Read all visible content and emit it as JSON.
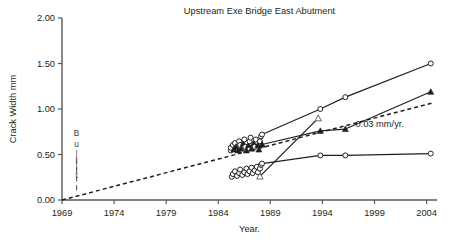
{
  "chart_data": {
    "type": "line",
    "title": "Upstream Exe Bridge East Abutment",
    "xlabel": "Year.",
    "ylabel": "Crack Width mm",
    "xlim": [
      1969,
      2005
    ],
    "ylim": [
      0.0,
      2.0
    ],
    "xticks": [
      1969,
      1974,
      1979,
      1984,
      1989,
      1994,
      1999,
      2004
    ],
    "xticklabels": [
      "1969",
      "1974",
      "1979",
      "1984",
      "1989",
      "1994",
      "1999",
      "2004"
    ],
    "yticks": [
      0.0,
      0.5,
      1.0,
      1.5,
      2.0
    ],
    "yticklabels": [
      "0.00",
      "0.50",
      "1.00",
      "1.50",
      "2.00"
    ],
    "grid": false,
    "legend": "none",
    "annotations": [
      {
        "text": "0.03 mm/yr.",
        "x": 1999.5,
        "y": 0.8,
        "note": "label for dashed reference trend line"
      },
      {
        "text": "Built",
        "x": 1970.4,
        "y": 0.55,
        "orientation": "vertical",
        "note": "vertical stacked letters beside dashed vertical marker at construction date"
      }
    ],
    "reference_line": {
      "name": "0.03 mm/yr.",
      "style": "dashed",
      "slope_mm_per_year": 0.03,
      "x": [
        1969,
        2004.5
      ],
      "y": [
        0.0,
        1.065
      ]
    },
    "series": [
      {
        "name": "Series A (open circle, upper)",
        "marker": "open-circle",
        "x": [
          1988.2,
          1993.8,
          1996.2,
          2004.4
        ],
        "y": [
          0.72,
          1.0,
          1.13,
          1.5
        ]
      },
      {
        "name": "Series B (filled triangle, upper)",
        "marker": "filled-triangle",
        "x": [
          1988.2,
          1993.8,
          1996.2,
          2004.4
        ],
        "y": [
          0.61,
          0.76,
          0.78,
          1.19
        ]
      },
      {
        "name": "Series C (steep riser crossing to open triangle)",
        "marker": "open-triangle",
        "x": [
          1988.0,
          1993.6
        ],
        "y": [
          0.26,
          0.9
        ]
      },
      {
        "name": "Series D (open circle, lower flat)",
        "marker": "open-circle",
        "x": [
          1988.2,
          1993.8,
          1996.2,
          2004.4
        ],
        "y": [
          0.4,
          0.49,
          0.49,
          0.51
        ]
      }
    ],
    "clusters": [
      {
        "name": "Upper measurement cluster",
        "marker": "mixed open-circle and filled-triangle",
        "x_range": [
          1985.0,
          1988.3
        ],
        "y_range": [
          0.52,
          0.72
        ],
        "points": [
          {
            "x": 1985.2,
            "y": 0.545,
            "m": "o"
          },
          {
            "x": 1985.2,
            "y": 0.575,
            "m": "o"
          },
          {
            "x": 1985.4,
            "y": 0.605,
            "m": "o"
          },
          {
            "x": 1985.5,
            "y": 0.555,
            "m": "t"
          },
          {
            "x": 1985.6,
            "y": 0.625,
            "m": "o"
          },
          {
            "x": 1985.7,
            "y": 0.585,
            "m": "t"
          },
          {
            "x": 1985.9,
            "y": 0.545,
            "m": "t"
          },
          {
            "x": 1986.0,
            "y": 0.645,
            "m": "o"
          },
          {
            "x": 1986.1,
            "y": 0.605,
            "m": "o"
          },
          {
            "x": 1986.2,
            "y": 0.565,
            "m": "t"
          },
          {
            "x": 1986.4,
            "y": 0.625,
            "m": "t"
          },
          {
            "x": 1986.5,
            "y": 0.665,
            "m": "o"
          },
          {
            "x": 1986.6,
            "y": 0.585,
            "m": "o"
          },
          {
            "x": 1986.7,
            "y": 0.545,
            "m": "t"
          },
          {
            "x": 1986.9,
            "y": 0.605,
            "m": "t"
          },
          {
            "x": 1987.0,
            "y": 0.645,
            "m": "o"
          },
          {
            "x": 1987.1,
            "y": 0.685,
            "m": "o"
          },
          {
            "x": 1987.2,
            "y": 0.565,
            "m": "t"
          },
          {
            "x": 1987.4,
            "y": 0.625,
            "m": "t"
          },
          {
            "x": 1987.5,
            "y": 0.585,
            "m": "o"
          },
          {
            "x": 1987.6,
            "y": 0.665,
            "m": "o"
          },
          {
            "x": 1987.8,
            "y": 0.605,
            "m": "t"
          },
          {
            "x": 1987.9,
            "y": 0.555,
            "m": "t"
          },
          {
            "x": 1988.0,
            "y": 0.645,
            "m": "o"
          },
          {
            "x": 1988.1,
            "y": 0.7,
            "m": "o"
          },
          {
            "x": 1988.2,
            "y": 0.61,
            "m": "t"
          }
        ]
      },
      {
        "name": "Lower measurement cluster",
        "marker": "open-circle",
        "x_range": [
          1985.0,
          1988.3
        ],
        "y_range": [
          0.24,
          0.4
        ],
        "points": [
          {
            "x": 1985.3,
            "y": 0.255,
            "m": "o"
          },
          {
            "x": 1985.4,
            "y": 0.285,
            "m": "o"
          },
          {
            "x": 1985.6,
            "y": 0.315,
            "m": "o"
          },
          {
            "x": 1985.8,
            "y": 0.265,
            "m": "o"
          },
          {
            "x": 1986.0,
            "y": 0.295,
            "m": "o"
          },
          {
            "x": 1986.1,
            "y": 0.335,
            "m": "o"
          },
          {
            "x": 1986.3,
            "y": 0.275,
            "m": "o"
          },
          {
            "x": 1986.5,
            "y": 0.305,
            "m": "o"
          },
          {
            "x": 1986.7,
            "y": 0.345,
            "m": "o"
          },
          {
            "x": 1986.8,
            "y": 0.285,
            "m": "o"
          },
          {
            "x": 1987.0,
            "y": 0.315,
            "m": "o"
          },
          {
            "x": 1987.2,
            "y": 0.355,
            "m": "o"
          },
          {
            "x": 1987.3,
            "y": 0.295,
            "m": "o"
          },
          {
            "x": 1987.5,
            "y": 0.325,
            "m": "o"
          },
          {
            "x": 1987.7,
            "y": 0.365,
            "m": "o"
          },
          {
            "x": 1987.8,
            "y": 0.305,
            "m": "o"
          },
          {
            "x": 1988.0,
            "y": 0.345,
            "m": "o"
          },
          {
            "x": 1988.1,
            "y": 0.385,
            "m": "o"
          }
        ]
      }
    ]
  },
  "built_marker": {
    "letters": [
      "B",
      "u",
      "i",
      "l",
      "t"
    ],
    "display": [
      "B",
      "u",
      "|",
      "|",
      "t"
    ]
  },
  "colors": {
    "ink": "#231f20",
    "axis": "#58585a",
    "background": "#ffffff"
  }
}
